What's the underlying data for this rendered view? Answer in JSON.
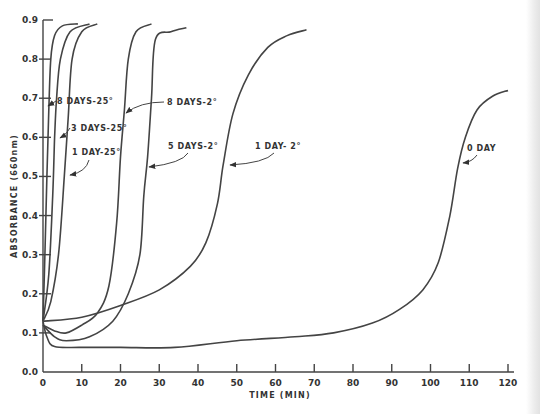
{
  "chart_data": {
    "type": "line",
    "title": "",
    "xlabel": "TIME (MIN)",
    "ylabel": "ABSORBANCE (660nm)",
    "xlim": [
      0,
      120
    ],
    "ylim": [
      0.0,
      0.9
    ],
    "grid": false,
    "legend_position": "inline annotations with arrows",
    "x_ticks": [
      0,
      10,
      20,
      30,
      40,
      50,
      60,
      70,
      80,
      90,
      100,
      110,
      120
    ],
    "y_ticks": [
      0.0,
      0.1,
      0.2,
      0.3,
      0.4,
      0.5,
      0.6,
      0.7,
      0.8,
      0.9
    ],
    "x_tick_labels": [
      "0",
      "10",
      "20",
      "30",
      "40",
      "50",
      "60",
      "70",
      "80",
      "90",
      "100",
      "110",
      "120"
    ],
    "y_tick_labels": [
      "0.0",
      "0.1",
      "0.2",
      "0.3",
      "0.4",
      "0.5",
      "0.6",
      "0.7",
      "0.8",
      "0.9"
    ],
    "series": [
      {
        "name": "8 DAYS-25°",
        "x": [
          0,
          0.5,
          1,
          1.5,
          2,
          3,
          5,
          9
        ],
        "y": [
          0.13,
          0.3,
          0.5,
          0.67,
          0.8,
          0.86,
          0.885,
          0.89
        ]
      },
      {
        "name": "3 DAYS-25°",
        "x": [
          0,
          1.5,
          2.5,
          3,
          3.5,
          4.5,
          7,
          12
        ],
        "y": [
          0.13,
          0.25,
          0.45,
          0.6,
          0.7,
          0.8,
          0.87,
          0.89
        ]
      },
      {
        "name": "1 DAY-25°",
        "x": [
          0,
          2,
          4,
          5.5,
          6.5,
          7.5,
          10,
          14
        ],
        "y": [
          0.13,
          0.18,
          0.3,
          0.5,
          0.65,
          0.8,
          0.87,
          0.89
        ]
      },
      {
        "name": "8 DAYS-2°",
        "x": [
          0,
          3,
          6,
          10,
          14,
          17,
          19,
          20,
          21,
          22,
          24,
          28
        ],
        "y": [
          0.12,
          0.105,
          0.1,
          0.12,
          0.15,
          0.22,
          0.38,
          0.55,
          0.67,
          0.8,
          0.87,
          0.89
        ]
      },
      {
        "name": "5 DAYS-2°",
        "x": [
          0,
          3,
          6,
          12,
          18,
          22,
          25,
          26,
          27,
          28,
          29,
          33,
          37
        ],
        "y": [
          0.12,
          0.09,
          0.08,
          0.09,
          0.13,
          0.2,
          0.3,
          0.45,
          0.55,
          0.7,
          0.85,
          0.87,
          0.88
        ]
      },
      {
        "name": "1 DAY-2°",
        "x": [
          0,
          10,
          20,
          30,
          38,
          42,
          45,
          46.5,
          49,
          53,
          58,
          63,
          68
        ],
        "y": [
          0.13,
          0.14,
          0.17,
          0.21,
          0.27,
          0.33,
          0.43,
          0.53,
          0.66,
          0.76,
          0.83,
          0.86,
          0.875
        ]
      },
      {
        "name": "0 DAY",
        "x": [
          0,
          1,
          3,
          10,
          20,
          34,
          50,
          65,
          75,
          85,
          92,
          98,
          102,
          105,
          107,
          109,
          112,
          116,
          120
        ],
        "y": [
          0.13,
          0.09,
          0.065,
          0.063,
          0.063,
          0.063,
          0.08,
          0.09,
          0.1,
          0.125,
          0.16,
          0.21,
          0.28,
          0.4,
          0.52,
          0.6,
          0.67,
          0.705,
          0.72
        ]
      }
    ],
    "annotations": [
      {
        "text": "8 DAYS-25°",
        "points_to": "8 DAYS-25°"
      },
      {
        "text": "3 DAYS-25°",
        "points_to": "3 DAYS-25°"
      },
      {
        "text": "1 DAY-25°",
        "points_to": "1 DAY-25°"
      },
      {
        "text": "8 DAYS-2°",
        "points_to": "8 DAYS-2°"
      },
      {
        "text": "5 DAYS-2°",
        "points_to": "5 DAYS-2°"
      },
      {
        "text": "1 DAY-2°",
        "points_to": "1 DAY-2°"
      },
      {
        "text": "0 DAY",
        "points_to": "0 DAY"
      }
    ]
  },
  "labels": {
    "xlabel": "TIME (MIN)",
    "ylabel": "ABSORBANCE (660nm)",
    "ann_8d25": "8 DAYS-25°",
    "ann_3d25": "3 DAYS-25°",
    "ann_1d25": "1 DAY-25°",
    "ann_8d2": "8 DAYS-2°",
    "ann_5d2": "5 DAYS-2°",
    "ann_1d2": "1 DAY- 2°",
    "ann_0d": "0 DAY"
  },
  "colors": {
    "line": "#444444",
    "text": "#333333",
    "background": "#ffffff"
  }
}
